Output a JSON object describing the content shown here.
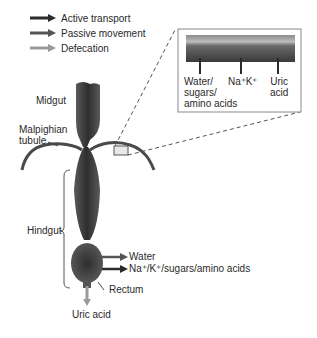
{
  "legend": {
    "items": [
      {
        "label": "Active transport",
        "color": "#2b2b2b"
      },
      {
        "label": "Passive movement",
        "color": "#555555"
      },
      {
        "label": "Defecation",
        "color": "#9a9a9a"
      }
    ]
  },
  "labels": {
    "midgut": "Midgut",
    "malpighian_line1": "Malpighian",
    "malpighian_line2": "tubule",
    "hindgut": "Hindgut",
    "rectum": "Rectum",
    "uric_acid_bottom": "Uric acid",
    "water": "Water",
    "ions": "Na⁺/K⁺/sugars/amino acids"
  },
  "inset": {
    "labels": [
      {
        "lines": [
          "Water/",
          "sugars/",
          "amino acids"
        ]
      },
      {
        "lines": [
          "Na⁺K⁺"
        ]
      },
      {
        "lines": [
          "Uric",
          "acid"
        ]
      }
    ]
  },
  "colors": {
    "gut": "#3a3a3a",
    "tubule": "#4a4a4a",
    "inset_border": "#888888",
    "inset_bg": "#e9e9e9"
  }
}
